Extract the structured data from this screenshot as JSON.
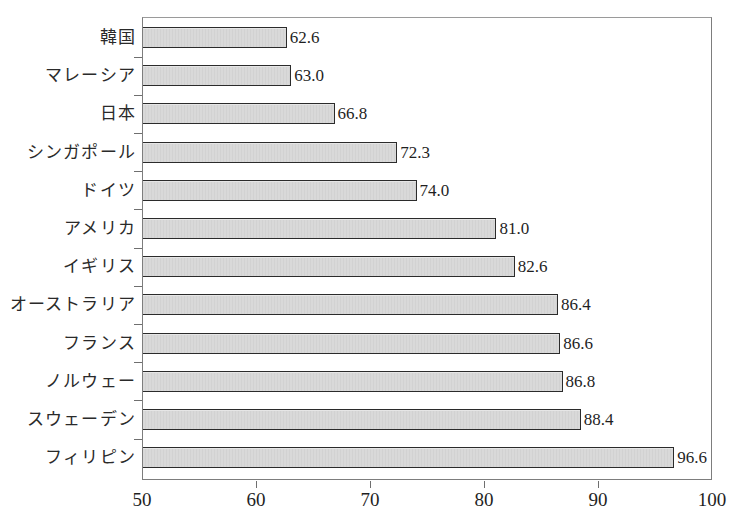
{
  "figure": {
    "scan_remnant_text": "",
    "bar_fill_color": "#d9d9d9",
    "bar_border_color": "#2b2b2b",
    "frame_color": "#7d7d7d",
    "text_color": "#1f1f1f"
  },
  "chart_data": {
    "type": "bar",
    "orientation": "horizontal",
    "title": "",
    "subtitle": "",
    "xlabel": "",
    "ylabel": "",
    "xlim": [
      50,
      100
    ],
    "ylim": null,
    "grid": false,
    "legend": null,
    "xticks": [
      50,
      60,
      70,
      80,
      90,
      100
    ],
    "xtick_labels": [
      "50",
      "60",
      "70",
      "80",
      "90",
      "100"
    ],
    "categories": [
      "韓国",
      "マレーシア",
      "日本",
      "シンガポール",
      "ドイツ",
      "アメリカ",
      "イギリス",
      "オーストラリア",
      "フランス",
      "ノルウェー",
      "スウェーデン",
      "フィリピン"
    ],
    "values": [
      62.6,
      63.0,
      66.8,
      72.3,
      74.0,
      81.0,
      82.6,
      86.4,
      86.6,
      86.8,
      88.4,
      96.6
    ],
    "data_labels": [
      "62.6",
      "63.0",
      "66.8",
      "72.3",
      "74.0",
      "81.0",
      "82.6",
      "86.4",
      "86.6",
      "86.8",
      "88.4",
      "96.6"
    ],
    "series": [
      {
        "name": "",
        "values": [
          62.6,
          63.0,
          66.8,
          72.3,
          74.0,
          81.0,
          82.6,
          86.4,
          86.6,
          86.8,
          88.4,
          96.6
        ]
      }
    ]
  }
}
